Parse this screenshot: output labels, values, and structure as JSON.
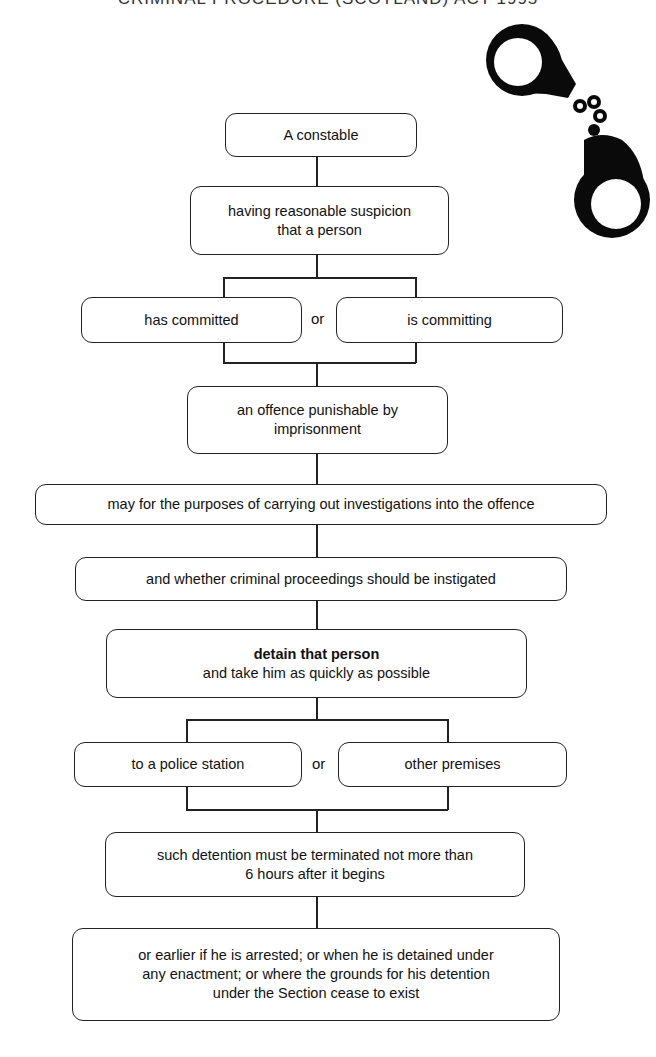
{
  "header": {
    "clipped_title": "CRIMINAL PROCEDURE (SCOTLAND) ACT 1995"
  },
  "illustration": {
    "icon": "handcuffs-icon"
  },
  "flowchart": {
    "start": "A constable",
    "suspicion": {
      "line1": "having reasonable suspicion",
      "line2": "that a person"
    },
    "branch1": {
      "left": "has committed",
      "connector": "or",
      "right": "is committing"
    },
    "offence": {
      "line1": "an offence punishable by",
      "line2": "imprisonment"
    },
    "purpose": "may for the purposes of carrying out investigations into the offence",
    "proceedings": "and whether criminal proceedings should be instigated",
    "detain": {
      "bold": "detain that person",
      "line2": "and take him as quickly as possible"
    },
    "branch2": {
      "left": "to a police station",
      "connector": "or",
      "right": "other premises"
    },
    "termination": {
      "line1": "such detention must be terminated not more than",
      "line2": "6 hours after it begins"
    },
    "exceptions": {
      "line1": "or earlier if he is arrested; or when he is detained under",
      "line2": "any enactment; or where the grounds for his detention",
      "line3": "under the Section cease to exist"
    }
  },
  "colors": {
    "line": "#222222",
    "background": "#ffffff",
    "text": "#111111"
  }
}
